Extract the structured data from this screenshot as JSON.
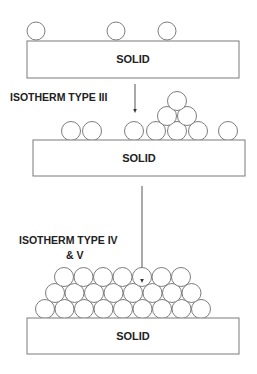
{
  "diagram": {
    "panels": [
      {
        "id": "monolayer-sparse",
        "solid": {
          "label": "SOLID",
          "x": 27,
          "y": 41,
          "w": 212,
          "h": 37,
          "text_x": 133,
          "text_y": 63
        },
        "molecules": [
          {
            "cx": 36,
            "cy": 31,
            "r": 9
          },
          {
            "cx": 116,
            "cy": 31,
            "r": 9
          },
          {
            "cx": 167,
            "cy": 31,
            "r": 9
          }
        ]
      },
      {
        "id": "type-iii",
        "caption": {
          "lines": [
            "ISOTHERM TYPE  III"
          ],
          "x": 10,
          "y": 101
        },
        "arrow": {
          "x": 135,
          "y1": 84,
          "y2": 113
        },
        "solid": {
          "label": "SOLID",
          "x": 33,
          "y": 140,
          "w": 212,
          "h": 36,
          "text_x": 139,
          "text_y": 162
        },
        "molecules": [
          {
            "cx": 71,
            "cy": 131,
            "r": 9.5
          },
          {
            "cx": 92,
            "cy": 131,
            "r": 9.5
          },
          {
            "cx": 134,
            "cy": 131,
            "r": 9.5
          },
          {
            "cx": 156,
            "cy": 131,
            "r": 9.5
          },
          {
            "cx": 177,
            "cy": 131,
            "r": 9.5
          },
          {
            "cx": 198,
            "cy": 131,
            "r": 9.5
          },
          {
            "cx": 228,
            "cy": 131,
            "r": 9.5
          },
          {
            "cx": 167,
            "cy": 116,
            "r": 9.5
          },
          {
            "cx": 187,
            "cy": 116,
            "r": 9.5
          },
          {
            "cx": 177,
            "cy": 101,
            "r": 9.5
          }
        ]
      },
      {
        "id": "type-iv-v",
        "caption": {
          "lines": [
            "ISOTHERM TYPE  IV",
            "& V"
          ],
          "x": 19,
          "y": 244,
          "line2_x": 66,
          "line2_y": 259
        },
        "arrow": {
          "x": 142,
          "y1": 186,
          "y2": 283
        },
        "solid": {
          "label": "SOLID",
          "x": 27,
          "y": 318,
          "w": 212,
          "h": 36,
          "text_x": 133,
          "text_y": 340
        },
        "rows": [
          {
            "count": 9,
            "start_cx": 45,
            "step": 19.5,
            "cy": 309,
            "r": 9.5
          },
          {
            "count": 8,
            "start_cx": 55,
            "step": 19.5,
            "cy": 293,
            "r": 9.5
          },
          {
            "count": 7,
            "start_cx": 64,
            "step": 19.5,
            "cy": 277,
            "r": 9.5
          }
        ]
      }
    ]
  },
  "labels": {
    "solid_1": "SOLID",
    "solid_2": "SOLID",
    "solid_3": "SOLID",
    "type_iii": "ISOTHERM TYPE  III",
    "type_iv_line1": "ISOTHERM TYPE  IV",
    "type_iv_line2": "& V"
  },
  "colors": {
    "background": "#ffffff",
    "outline": "#6e6e6e",
    "text": "#222222"
  }
}
